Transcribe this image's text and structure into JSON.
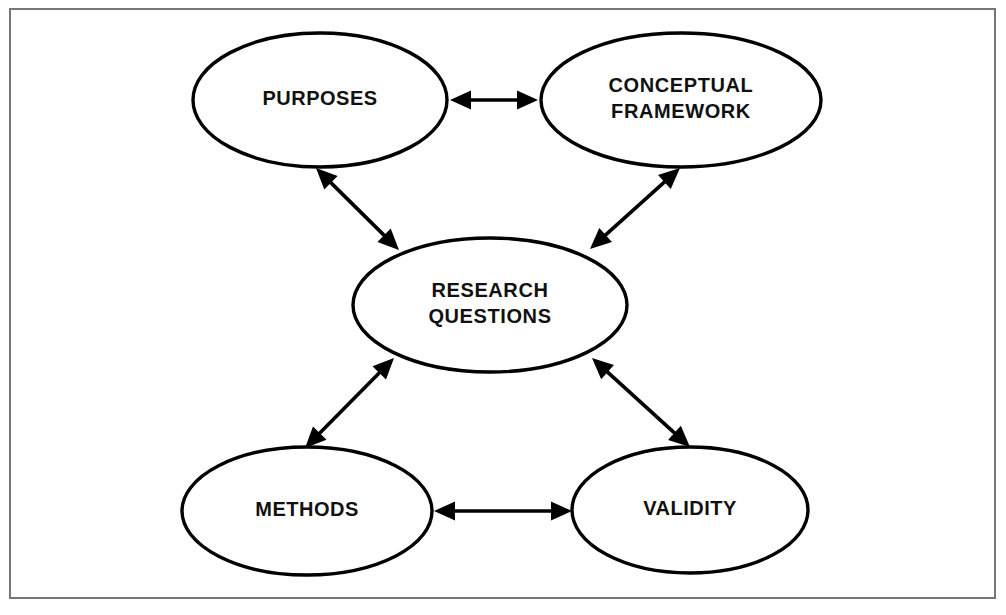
{
  "canvas": {
    "width": 1006,
    "height": 615,
    "background": "#ffffff"
  },
  "frame": {
    "name": "outer-border",
    "x": 10,
    "y": 9,
    "width": 985,
    "height": 589,
    "stroke": "#777777",
    "stroke_width": 2
  },
  "style": {
    "node_fill": "#ffffff",
    "node_stroke": "#000000",
    "node_stroke_width": 3.4,
    "text_color": "#111111",
    "connector_color": "#000000",
    "connector_width": 3.6
  },
  "chart_data": {
    "type": "diagram",
    "layout": "hub-and-spoke, five nodes, center hub linked to four outer nodes",
    "nodes": [
      {
        "id": "purposes",
        "label": "PURPOSES",
        "lines": [
          "PURPOSES"
        ],
        "cx": 320,
        "cy": 100,
        "rx": 127,
        "ry": 67,
        "font_size": 20
      },
      {
        "id": "conceptual-framework",
        "label": "CONCEPTUAL FRAMEWORK",
        "lines": [
          "CONCEPTUAL",
          "FRAMEWORK"
        ],
        "cx": 681,
        "cy": 100,
        "rx": 140,
        "ry": 67,
        "font_size": 20
      },
      {
        "id": "research-questions",
        "label": "RESEARCH QUESTIONS",
        "lines": [
          "RESEARCH",
          "QUESTIONS"
        ],
        "cx": 490,
        "cy": 305,
        "rx": 137,
        "ry": 67,
        "font_size": 20
      },
      {
        "id": "methods",
        "label": "METHODS",
        "lines": [
          "METHODS"
        ],
        "cx": 307,
        "cy": 511,
        "rx": 125,
        "ry": 64,
        "font_size": 20
      },
      {
        "id": "validity",
        "label": "VALIDITY",
        "lines": [
          "VALIDITY"
        ],
        "cx": 690,
        "cy": 510,
        "rx": 118,
        "ry": 63,
        "font_size": 20
      }
    ],
    "edges": [
      {
        "id": "purposes-conceptual-framework",
        "from": "purposes",
        "to": "conceptual-framework",
        "direction": "bidirectional",
        "x1": 450,
        "y1": 100,
        "x2": 538,
        "y2": 100
      },
      {
        "id": "purposes-research-questions",
        "from": "purposes",
        "to": "research-questions",
        "direction": "bidirectional",
        "x1": 316,
        "y1": 168,
        "x2": 399,
        "y2": 250
      },
      {
        "id": "conceptual-framework-research-questions",
        "from": "conceptual-framework",
        "to": "research-questions",
        "direction": "bidirectional",
        "x1": 680,
        "y1": 168,
        "x2": 590,
        "y2": 249
      },
      {
        "id": "methods-research-questions",
        "from": "methods",
        "to": "research-questions",
        "direction": "bidirectional",
        "x1": 305,
        "y1": 448,
        "x2": 394,
        "y2": 358
      },
      {
        "id": "validity-research-questions",
        "from": "validity",
        "to": "research-questions",
        "direction": "bidirectional",
        "x1": 690,
        "y1": 447,
        "x2": 592,
        "y2": 358
      },
      {
        "id": "methods-validity",
        "from": "methods",
        "to": "validity",
        "direction": "bidirectional",
        "x1": 434,
        "y1": 511,
        "x2": 572,
        "y2": 511
      }
    ]
  }
}
